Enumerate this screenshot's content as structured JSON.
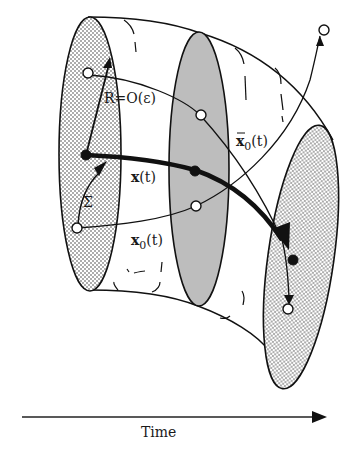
{
  "figure": {
    "type": "tube-of-trajectories diagram",
    "colors": {
      "ink": "#111111",
      "gray_section": "#bdbdbd",
      "dotted_fill": "#ffffff",
      "dot": "#333333",
      "background": "#ffffff"
    },
    "labels": {
      "radius": "R=O(ε)",
      "sigma": "Σ",
      "x_main": "x",
      "x_main_arg": "(t)",
      "x0": "x",
      "x0_sub": "0",
      "x0_arg": "(t)",
      "x0bar": "x",
      "x0bar_sub": "0",
      "x0bar_arg": "(t)"
    },
    "time_axis": {
      "label": "Time",
      "direction": "right"
    },
    "sections": [
      {
        "name": "initial-section",
        "fill": "dotted"
      },
      {
        "name": "middle-section",
        "fill": "gray"
      },
      {
        "name": "final-section",
        "fill": "dotted"
      }
    ],
    "trajectories": [
      {
        "name": "x(t)",
        "style": "thick",
        "markers": "filled"
      },
      {
        "name": "x0(t)",
        "style": "thin",
        "markers": "open"
      },
      {
        "name": "x0bar(t)",
        "style": "thin",
        "markers": "open"
      },
      {
        "name": "escaping-trajectory",
        "style": "thin",
        "markers": "open"
      }
    ]
  }
}
